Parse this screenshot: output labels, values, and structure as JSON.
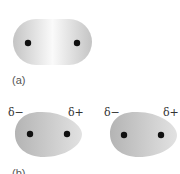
{
  "figure": {
    "panel_a": {
      "label": "(a)",
      "description": "symmetric electron cloud between two nuclei"
    },
    "panel_b": {
      "label": "(b)",
      "molecules": [
        {
          "left_charge": "δ−",
          "right_charge": "δ+"
        },
        {
          "left_charge": "δ−",
          "right_charge": "δ+"
        }
      ]
    },
    "colors": {
      "cloud_dark": "#b8b8b8",
      "cloud_light": "#f4f4f4",
      "nucleus": "#111111"
    }
  }
}
